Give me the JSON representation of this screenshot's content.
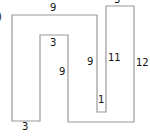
{
  "diagram": {
    "type": "rectilinear-polygon",
    "stroke_color": "#9a9a9a",
    "fill_color": "#ffffff",
    "text_color": "#111111",
    "partial_marker": ")",
    "labels": [
      {
        "id": "top-outer",
        "text": "9"
      },
      {
        "id": "inner-top",
        "text": "3"
      },
      {
        "id": "inner-right",
        "text": "9"
      },
      {
        "id": "slot-left",
        "text": "9"
      },
      {
        "id": "slot-right",
        "text": "11"
      },
      {
        "id": "right-outer",
        "text": "12"
      },
      {
        "id": "slot-bottom",
        "text": "1"
      },
      {
        "id": "left-leg-bottom",
        "text": "3"
      },
      {
        "id": "right-top",
        "text": "3"
      }
    ]
  }
}
